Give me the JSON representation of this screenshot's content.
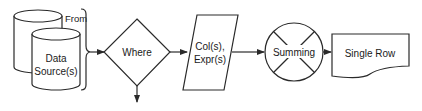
{
  "diagram": {
    "type": "flowchart",
    "stroke_color": "#2a2a2a",
    "background": "#ffffff",
    "nodes": {
      "data_source": {
        "shape": "cylinder-stack",
        "line1": "Data",
        "line2": "Source(s)"
      },
      "from_label": {
        "shape": "brace",
        "label": "From"
      },
      "where": {
        "shape": "diamond",
        "label": "Where"
      },
      "columns": {
        "shape": "parallelogram",
        "line1": "Col(s),",
        "line2": "Expr(s)"
      },
      "summing": {
        "shape": "circle-x",
        "label": "Summing"
      },
      "single_row": {
        "shape": "document",
        "label": "Single Row"
      }
    },
    "edges": [
      {
        "from": "data_source",
        "to": "where"
      },
      {
        "from": "where",
        "to": "columns"
      },
      {
        "from": "where",
        "to": "below",
        "direction": "down"
      },
      {
        "from": "columns",
        "to": "summing"
      },
      {
        "from": "summing",
        "to": "single_row"
      }
    ]
  }
}
